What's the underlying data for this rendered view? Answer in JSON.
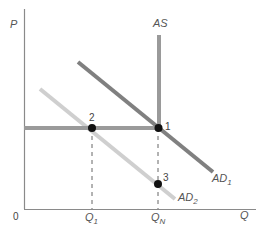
{
  "diagram": {
    "type": "aggregate demand / aggregate supply",
    "axes": {
      "y_label": "P",
      "x_label": "Q",
      "origin_label": "0",
      "x_ticks": [
        {
          "main": "Q",
          "sub": "1"
        },
        {
          "main": "Q",
          "sub": "N"
        }
      ]
    },
    "curves": {
      "as": {
        "label": "AS",
        "color": "#9a9a9a"
      },
      "ad1": {
        "label_main": "AD",
        "label_sub": "1",
        "color": "#808080"
      },
      "ad2": {
        "label_main": "AD",
        "label_sub": "2",
        "color": "#cfcfcf"
      },
      "price_floor": {
        "color": "#9a9a9a"
      }
    },
    "points": [
      {
        "label": "1"
      },
      {
        "label": "2"
      },
      {
        "label": "3"
      }
    ],
    "colors": {
      "axis": "#8a8a8a",
      "point": "#111111",
      "dashed": "#666666"
    }
  }
}
